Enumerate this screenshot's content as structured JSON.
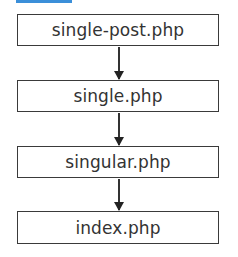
{
  "header": {
    "accent_color": "#3b8fd9"
  },
  "flow": {
    "nodes": [
      {
        "label": "single-post.php"
      },
      {
        "label": "single.php"
      },
      {
        "label": "singular.php"
      },
      {
        "label": "index.php"
      }
    ],
    "edges": [
      {
        "from": "single-post.php",
        "to": "single.php"
      },
      {
        "from": "single.php",
        "to": "singular.php"
      },
      {
        "from": "singular.php",
        "to": "index.php"
      }
    ]
  }
}
